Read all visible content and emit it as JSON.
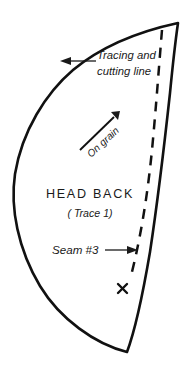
{
  "document": {
    "type": "sewing-pattern-piece",
    "piece_name": "HEAD BACK",
    "trace_note": "( Trace 1)",
    "background_color": "#ffffff",
    "ink_color": "#111111"
  },
  "annotations": {
    "tracing_line_label_line1": "Tracing and",
    "tracing_line_label_line2": "cutting line",
    "grain_label": "On grain",
    "seam_label": "Seam #3",
    "x_mark_label": "×"
  },
  "icons": {
    "tracing_arrow": "arrow-left-icon",
    "grain_arrow": "arrow-up-right-icon",
    "seam_arrow": "arrow-right-icon",
    "x_marker": "x-mark-icon"
  }
}
